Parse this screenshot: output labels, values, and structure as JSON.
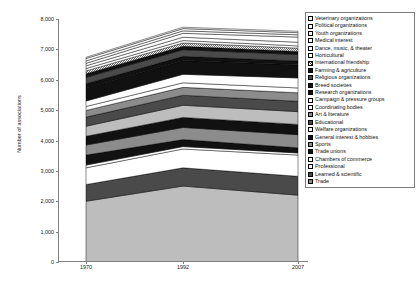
{
  "chart_data": {
    "type": "area",
    "title": "",
    "xlabel": "",
    "ylabel": "Number of associations",
    "x": [
      "1970",
      "1992",
      "2007"
    ],
    "ylim": [
      0,
      8000
    ],
    "yticks": [
      "0",
      "1,000",
      "2,000",
      "3,000",
      "4,000",
      "5,000",
      "6,000",
      "7,000",
      "8,000"
    ],
    "ytick_values": [
      0,
      1000,
      2000,
      3000,
      4000,
      5000,
      6000,
      7000,
      8000
    ],
    "grid": false,
    "stacked": true,
    "legend_position": "right",
    "totals": [
      6600,
      7350,
      7150
    ],
    "series": [
      {
        "name": "Trade",
        "fill": "light-gray",
        "values": [
          2000,
          2500,
          2200
        ]
      },
      {
        "name": "Learned & scientific",
        "fill": "dark-gray",
        "values": [
          550,
          600,
          620
        ]
      },
      {
        "name": "Professional",
        "fill": "white",
        "values": [
          550,
          620,
          700
        ]
      },
      {
        "name": "Chambers of commerce",
        "fill": "white",
        "values": [
          90,
          80,
          70
        ]
      },
      {
        "name": "Trade unions",
        "fill": "black",
        "values": [
          330,
          230,
          170
        ]
      },
      {
        "name": "Sports",
        "fill": "medium-gray",
        "values": [
          330,
          400,
          430
        ]
      },
      {
        "name": "General interest & hobbies",
        "fill": "black",
        "values": [
          290,
          330,
          340
        ]
      },
      {
        "name": "Welfare organizations",
        "fill": "light-gray",
        "values": [
          330,
          400,
          420
        ]
      },
      {
        "name": "Educational",
        "fill": "dark-gray",
        "values": [
          300,
          330,
          340
        ]
      },
      {
        "name": "Art & literature",
        "fill": "medium-gray",
        "values": [
          220,
          260,
          280
        ]
      },
      {
        "name": "Coordinating bodies",
        "fill": "white",
        "values": [
          130,
          150,
          160
        ]
      },
      {
        "name": "Campaign & pressure groups",
        "fill": "white",
        "values": [
          180,
          280,
          330
        ]
      },
      {
        "name": "Research organizations",
        "fill": "black",
        "values": [
          420,
          450,
          430
        ]
      },
      {
        "name": "Breed societies",
        "fill": "black",
        "values": [
          150,
          140,
          130
        ]
      },
      {
        "name": "Religious organizations",
        "fill": "dark-gray",
        "values": [
          210,
          220,
          210
        ]
      },
      {
        "name": "Farming & agriculture",
        "fill": "black",
        "values": [
          120,
          110,
          100
        ]
      },
      {
        "name": "International friendship",
        "fill": "hatch-gray",
        "values": [
          90,
          110,
          110
        ]
      },
      {
        "name": "Horticultural",
        "fill": "white",
        "values": [
          80,
          80,
          75
        ]
      },
      {
        "name": "Dance, music, & theater",
        "fill": "white",
        "values": [
          90,
          110,
          120
        ]
      },
      {
        "name": "Medical interest",
        "fill": "white",
        "values": [
          80,
          130,
          170
        ]
      },
      {
        "name": "Youth organizations",
        "fill": "white",
        "values": [
          80,
          80,
          75
        ]
      },
      {
        "name": "Political organizations",
        "fill": "white",
        "values": [
          80,
          75,
          70
        ]
      },
      {
        "name": "Veterinary organizations",
        "fill": "white",
        "values": [
          40,
          45,
          45
        ]
      }
    ]
  },
  "legend": {
    "items": [
      {
        "label": "Veterinary organizations",
        "swatch": "white"
      },
      {
        "label": "Political organizations",
        "swatch": "white"
      },
      {
        "label": "Youth organizations",
        "swatch": "white"
      },
      {
        "label": "Medical interest",
        "swatch": "white"
      },
      {
        "label": "Dance, music, & theater",
        "swatch": "white"
      },
      {
        "label": "Horticultural",
        "swatch": "white"
      },
      {
        "label": "International friendship",
        "swatch": "hatch"
      },
      {
        "label": "Farming & agriculture",
        "swatch": "black"
      },
      {
        "label": "Religious organizations",
        "swatch": "dark"
      },
      {
        "label": "Breed societies",
        "swatch": "black"
      },
      {
        "label": "Research organizations",
        "swatch": "black"
      },
      {
        "label": "Campaign & pressure groups",
        "swatch": "white"
      },
      {
        "label": "Coordinating bodies",
        "swatch": "white"
      },
      {
        "label": "Art & literature",
        "swatch": "medium"
      },
      {
        "label": "Educational",
        "swatch": "dark"
      },
      {
        "label": "Welfare organizations",
        "swatch": "white"
      },
      {
        "label": "General interest & hobbies",
        "swatch": "black"
      },
      {
        "label": "Sports",
        "swatch": "medium"
      },
      {
        "label": "Trade unions",
        "swatch": "black"
      },
      {
        "label": "Chambers of commerce",
        "swatch": "white"
      },
      {
        "label": "Professional",
        "swatch": "white"
      },
      {
        "label": "Learned & scientific",
        "swatch": "dark"
      },
      {
        "label": "Trade",
        "swatch": "medium"
      }
    ]
  }
}
